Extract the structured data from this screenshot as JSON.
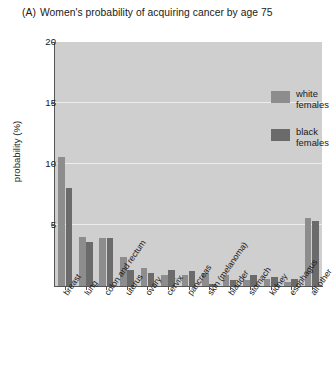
{
  "title": {
    "panel_letter": "(A)",
    "text": "Women's probability of acquiring cancer by age 75"
  },
  "axes": {
    "ylabel": "probability (%)",
    "xlabel": "",
    "y_ticks": [
      "5",
      "10",
      "15",
      "20"
    ],
    "ymax_label": "20"
  },
  "legend": {
    "entries": [
      {
        "label_line1": "white",
        "label_line2": "females",
        "color": "#8d8d8d"
      },
      {
        "label_line1": "black",
        "label_line2": "females",
        "color": "#6b6b6b"
      }
    ]
  },
  "chart_data": {
    "type": "bar",
    "xlabel": "",
    "ylabel": "probability (%)",
    "ylim": [
      0,
      20
    ],
    "yticks": [
      0,
      5,
      10,
      15,
      20
    ],
    "grid": true,
    "legend_position": "top-right",
    "categories": [
      "breast",
      "lung",
      "colon and rectum",
      "uterus",
      "ovary",
      "cervix",
      "pancreas",
      "skin (melanoma)",
      "bladder",
      "stomach",
      "kidney",
      "esophagus",
      "all other"
    ],
    "series": [
      {
        "name": "white females",
        "color": "#8d8d8d",
        "values": [
          10.6,
          4.0,
          3.9,
          2.4,
          1.5,
          0.9,
          0.9,
          1.1,
          0.9,
          0.5,
          0.6,
          0.3,
          5.6
        ]
      },
      {
        "name": "black females",
        "color": "#6b6b6b",
        "values": [
          8.0,
          3.6,
          3.9,
          1.3,
          1.1,
          1.3,
          1.2,
          0.2,
          0.5,
          0.9,
          0.7,
          0.6,
          5.3
        ]
      }
    ]
  },
  "colors": {
    "plot_background": "#cfcfcf",
    "gridline": "#ededed",
    "axis": "#555555",
    "text": "#1a1a1a"
  }
}
